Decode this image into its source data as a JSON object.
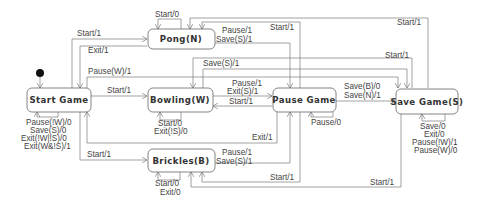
{
  "diagram": {
    "type": "state-machine",
    "initial_state": "Start Game",
    "states": [
      {
        "id": "start",
        "label": "Start Game"
      },
      {
        "id": "pong",
        "label": "Pong(N)"
      },
      {
        "id": "bowling",
        "label": "Bowling(W)"
      },
      {
        "id": "brickles",
        "label": "Brickles(B)"
      },
      {
        "id": "pause",
        "label": "Pause Game"
      },
      {
        "id": "save",
        "label": "Save Game(S)"
      }
    ],
    "labels": {
      "start_to_pong": "Start/1",
      "pong_to_start": "Exit/1",
      "start_to_save": "Pause(W)/1",
      "start_to_bowling": "Start/1",
      "start_to_brickles": "Start/1",
      "start_self": [
        "Pause(!W)/0",
        "Save(S)/0",
        "Exit(!W|!S)/0",
        "Exit(W&!S)/1"
      ],
      "pong_self": "Start/0",
      "pong_to_pause": [
        "Pause/1",
        "Save(S)/1"
      ],
      "pause_to_pong": "Start/1",
      "save_to_pong": "Start/1",
      "bowling_to_save": "Save(S)/1",
      "bowling_to_pause": [
        "Pause/1",
        "Exit(S)/1"
      ],
      "pause_to_bowling": "Start/1",
      "bowling_self": [
        "Start/0",
        "Exit(!S)/0"
      ],
      "pause_to_start": "Exit/1",
      "pause_self": "Pause/0",
      "pause_to_save": [
        "Save(B)/0",
        "Save(N)/1"
      ],
      "save_to_bowling": "Start/1",
      "save_self": [
        "Save/0",
        "Exit/0",
        "Pause(!W)/1",
        "Pause(W)/0"
      ],
      "brickles_to_pause": [
        "Pause/1",
        "Save(S)/1"
      ],
      "brickles_self": [
        "Start/0",
        "Exit/0"
      ],
      "pause_to_brickles": "Start/1",
      "save_to_brickles": "Start/1"
    }
  }
}
